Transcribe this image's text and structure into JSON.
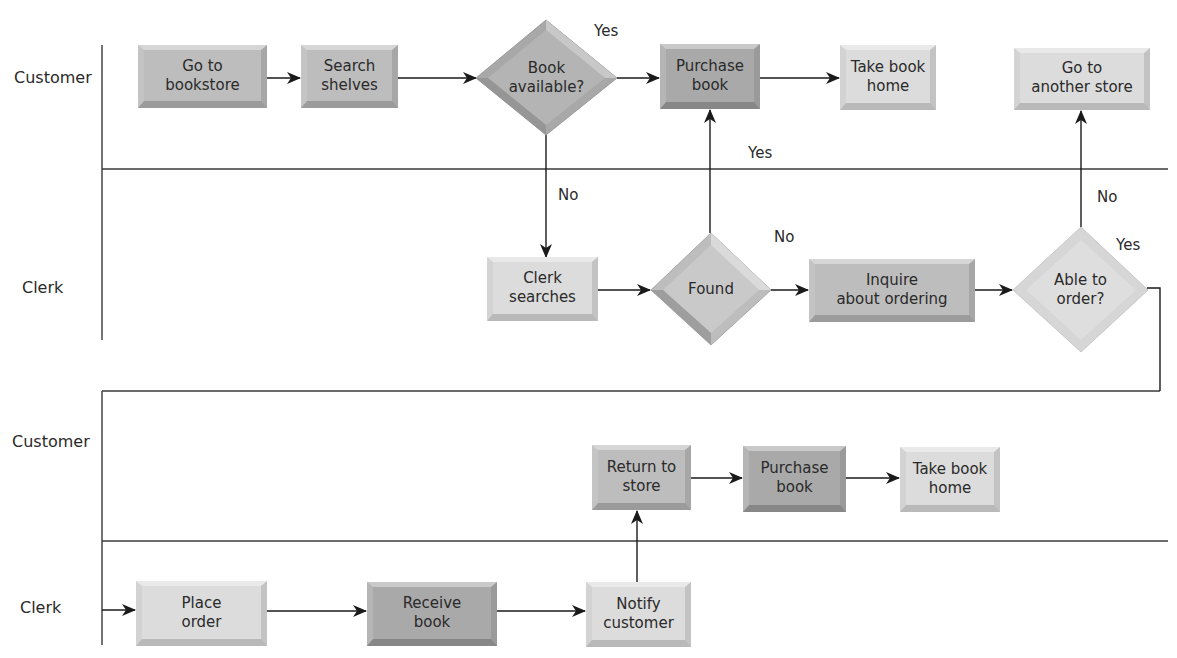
{
  "diagram": {
    "type": "swimlane-flowchart",
    "lanes": {
      "top_customer": "Customer",
      "top_clerk": "Clerk",
      "bottom_customer": "Customer",
      "bottom_clerk": "Clerk"
    },
    "nodes": {
      "go_to_bookstore": "Go to\nbookstore",
      "search_shelves": "Search\nshelves",
      "book_available": "Book\navailable?",
      "purchase_book_1": "Purchase\nbook",
      "take_book_home_1": "Take book\nhome",
      "go_to_another_store": "Go to\nanother store",
      "clerk_searches": "Clerk\nsearches",
      "found": "Found",
      "inquire_about_ordering": "Inquire\nabout ordering",
      "able_to_order": "Able to\norder?",
      "return_to_store": "Return to\nstore",
      "purchase_book_2": "Purchase\nbook",
      "take_book_home_2": "Take book\nhome",
      "place_order": "Place\norder",
      "receive_book": "Receive\nbook",
      "notify_customer": "Notify\ncustomer"
    },
    "edge_labels": {
      "book_available_yes": "Yes",
      "book_available_no": "No",
      "found_yes": "Yes",
      "found_no": "No",
      "able_to_order_no": "No",
      "able_to_order_yes": "Yes"
    }
  }
}
